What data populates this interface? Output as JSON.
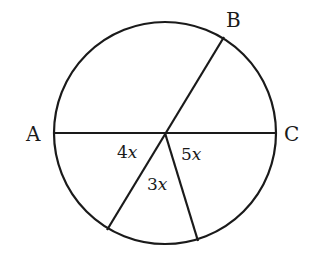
{
  "diagram": {
    "type": "circle-with-diameter-and-radii",
    "circle": {
      "cx": 165,
      "cy": 133,
      "r": 111
    },
    "center": {
      "x": 165,
      "y": 133
    },
    "points": [
      {
        "label": "A",
        "x": 54,
        "y": 133
      },
      {
        "label": "B",
        "x": 224,
        "y": 37
      },
      {
        "label": "C",
        "x": 276,
        "y": 133
      }
    ],
    "lower_points": [
      {
        "x": 107,
        "y": 230
      },
      {
        "x": 198,
        "y": 241
      }
    ],
    "angle_labels": [
      {
        "coef": "4",
        "var": "x",
        "x": 117,
        "y": 158
      },
      {
        "coef": "3",
        "var": "x",
        "x": 147,
        "y": 190
      },
      {
        "coef": "5",
        "var": "x",
        "x": 181,
        "y": 160
      }
    ],
    "stroke_color": "#1a1a1a"
  }
}
